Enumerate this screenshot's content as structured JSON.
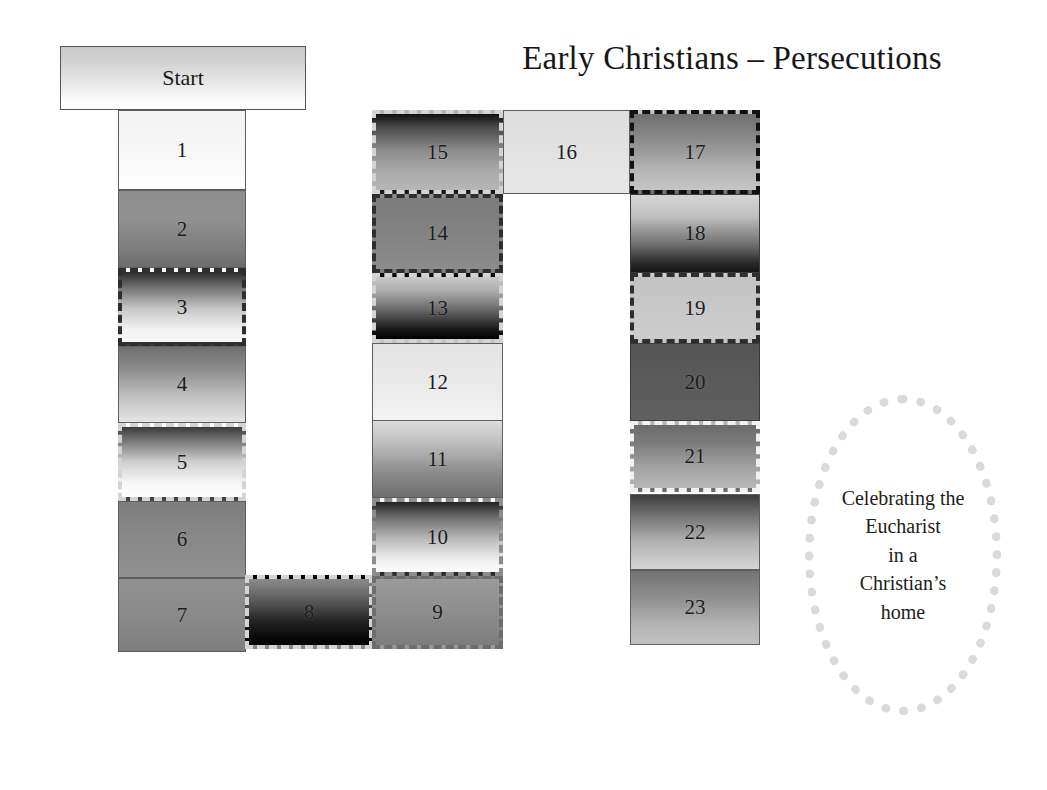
{
  "header": {
    "title": "Early Christians – Persecutions"
  },
  "start": {
    "label": "Start"
  },
  "callout": {
    "line1": "Celebrating the",
    "line2": "Eucharist",
    "line3": "in a",
    "line4": "Christian’s",
    "line5": "home"
  },
  "colors": {
    "page_background": "#ffffff",
    "text": "#1a1a1a",
    "border_black": "#111113",
    "border_dark": "#2e2e30",
    "border_gray": "#6d6d70",
    "border_light": "#d4d4d6",
    "border_white": "#f1f1f2",
    "callout_dots": "#dadade"
  },
  "cells": [
    {
      "label": "1",
      "border": "bd-solid-thin",
      "gradient": "linear-gradient(to bottom, #f3f3f3 0%, #f7f7f7 55%, #fefefe 100%)"
    },
    {
      "label": "2",
      "border": "bd-solid-thin",
      "gradient": "linear-gradient(to bottom, #8d8d8d 0%, #909090 38%, #7c7c7c 78%, #6b6b6b 100%)"
    },
    {
      "label": "3",
      "border": "bd-dash-dark",
      "gradient": "linear-gradient(to bottom, #2b2b2b 0%, #717171 22%, #c5c5c5 52%, #f2f2f2 82%, #f7f7f7 100%)"
    },
    {
      "label": "4",
      "border": "bd-solid-thin",
      "gradient": "linear-gradient(to bottom, #6f6f6f 0%, #8b8b8b 28%, #c0c0c0 66%, #e4e4e4 100%)"
    },
    {
      "label": "5",
      "border": "bd-dash-light",
      "gradient": "linear-gradient(to bottom, #3b3b3b 0%, #787878 20%, #cfcfcf 50%, #f6f6f6 80%, #ffffff 100%)"
    },
    {
      "label": "6",
      "border": "bd-solid-thin",
      "gradient": "linear-gradient(to bottom, #7d7d7d 0%, #888888 45%, #909090 100%)"
    },
    {
      "label": "7",
      "border": "bd-solid-thin",
      "gradient": "linear-gradient(to bottom, #909090 0%, #8a8a8a 50%, #7e7e7e 100%)"
    },
    {
      "label": "8",
      "border": "bd-dash-light",
      "gradient": "linear-gradient(to bottom, #8b8b8b 0%, #5e5e5e 30%, #262626 62%, #090909 88%, #050505 100%)"
    },
    {
      "label": "9",
      "border": "bd-dash-gray",
      "gradient": "linear-gradient(to bottom, #9a9a9a 0%, #8f8f8f 45%, #7d7d7d 100%)"
    },
    {
      "label": "10",
      "border": "bd-dash-mgray",
      "gradient": "linear-gradient(to bottom, #222222 0%, #6e6e6e 22%, #bdbdbd 54%, #f0f0f0 84%, #fbfbfb 100%)"
    },
    {
      "label": "11",
      "border": "bd-solid-thin",
      "gradient": "linear-gradient(to bottom, #dcdcdc 0%, #bdbdbd 30%, #8e8e8e 66%, #6e6e6e 100%)"
    },
    {
      "label": "12",
      "border": "bd-solid-thin",
      "gradient": "linear-gradient(to bottom, #e3e3e3 0%, #eaeaea 50%, #f3f3f3 100%)"
    },
    {
      "label": "13",
      "border": "bd-dash-light",
      "gradient": "linear-gradient(to bottom, #c9c9c9 0%, #aeaeae 22%, #6a6a6a 52%, #1e1e1e 82%, #000000 100%)"
    },
    {
      "label": "14",
      "border": "bd-dash-dark",
      "gradient": "linear-gradient(to bottom, #7b7b7b 0%, #828282 45%, #8c8c8c 100%)"
    },
    {
      "label": "15",
      "border": "bd-dash-light",
      "gradient": "linear-gradient(to bottom, #101010 0%, #4b4b4b 18%, #8c8c8c 48%, #adadad 78%, #b6b6b6 100%)"
    },
    {
      "label": "16",
      "border": "bd-solid-thin",
      "gradient": "linear-gradient(to bottom, #dedede 0%, #e2e2e2 50%, #e6e6e6 100%)"
    },
    {
      "label": "17",
      "border": "bd-dash-black",
      "gradient": "linear-gradient(to bottom, #6e6e6e 0%, #8c8c8c 35%, #b3b3b3 72%, #c6c6c6 100%)"
    },
    {
      "label": "18",
      "border": "bd-solid-dark",
      "gradient": "linear-gradient(to bottom, #d5d5d5 0%, #bfbfbf 28%, #757575 62%, #2a2a2a 88%, #161616 100%)"
    },
    {
      "label": "19",
      "border": "bd-dash-dark",
      "gradient": "linear-gradient(to bottom, #c3c3c3 0%, #c8c8c8 50%, #cccccc 100%)"
    },
    {
      "label": "20",
      "border": "bd-solid-dark",
      "gradient": "linear-gradient(to bottom, #555555 0%, #5a5a5a 50%, #606060 100%)"
    },
    {
      "label": "21",
      "border": "bd-dash-white",
      "gradient": "linear-gradient(to bottom, #6a6a6a 0%, #7d7d7d 30%, #a3a3a3 68%, #b8b8b8 100%)"
    },
    {
      "label": "22",
      "border": "bd-solid-thin",
      "gradient": "linear-gradient(to bottom, #3c3c3c 0%, #6e6e6e 25%, #b0b0b0 62%, #d6d6d6 100%)"
    },
    {
      "label": "23",
      "border": "bd-solid-thin",
      "gradient": "linear-gradient(to bottom, #737373 0%, #8d8d8d 35%, #b4b4b4 74%, #c2c2c2 100%)"
    }
  ],
  "layout": {
    "positions": [
      {
        "left": 118,
        "top": 110,
        "width": 128,
        "height": 80
      },
      {
        "left": 118,
        "top": 190,
        "width": 128,
        "height": 78
      },
      {
        "left": 118,
        "top": 268,
        "width": 128,
        "height": 78
      },
      {
        "left": 118,
        "top": 346,
        "width": 128,
        "height": 77
      },
      {
        "left": 118,
        "top": 423,
        "width": 128,
        "height": 78
      },
      {
        "left": 118,
        "top": 501,
        "width": 128,
        "height": 77
      },
      {
        "left": 118,
        "top": 578,
        "width": 128,
        "height": 74
      },
      {
        "left": 245,
        "top": 575,
        "width": 128,
        "height": 74
      },
      {
        "left": 372,
        "top": 575,
        "width": 131,
        "height": 74
      },
      {
        "left": 372,
        "top": 498,
        "width": 131,
        "height": 78
      },
      {
        "left": 372,
        "top": 420,
        "width": 131,
        "height": 78
      },
      {
        "left": 372,
        "top": 343,
        "width": 131,
        "height": 78
      },
      {
        "left": 372,
        "top": 273,
        "width": 131,
        "height": 70
      },
      {
        "left": 372,
        "top": 194,
        "width": 131,
        "height": 79
      },
      {
        "left": 372,
        "top": 110,
        "width": 131,
        "height": 84
      },
      {
        "left": 503,
        "top": 110,
        "width": 127,
        "height": 84
      },
      {
        "left": 630,
        "top": 110,
        "width": 130,
        "height": 84
      },
      {
        "left": 630,
        "top": 194,
        "width": 130,
        "height": 79
      },
      {
        "left": 630,
        "top": 273,
        "width": 130,
        "height": 70
      },
      {
        "left": 630,
        "top": 343,
        "width": 130,
        "height": 78
      },
      {
        "left": 630,
        "top": 421,
        "width": 130,
        "height": 71
      },
      {
        "left": 630,
        "top": 494,
        "width": 130,
        "height": 76
      },
      {
        "left": 630,
        "top": 570,
        "width": 130,
        "height": 75
      }
    ]
  }
}
